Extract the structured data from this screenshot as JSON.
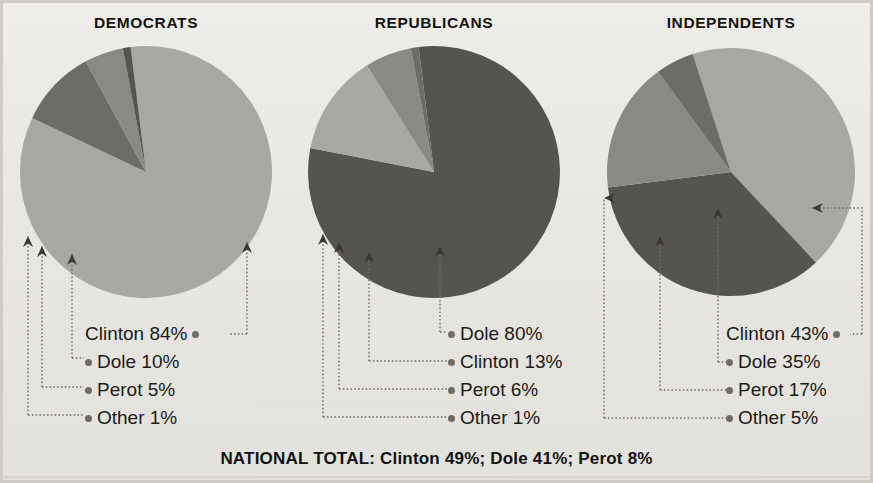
{
  "chart_data": [
    {
      "type": "pie",
      "title": "DEMOCRATS",
      "categories": [
        "Clinton",
        "Dole",
        "Perot",
        "Other"
      ],
      "values": [
        84,
        10,
        5,
        1
      ],
      "labels": [
        "Clinton 84%",
        "Dole 10%",
        "Perot 5%",
        "Other 1%"
      ],
      "colors": [
        "#a9a7a2",
        "#6e6c68",
        "#8b8984",
        "#565451"
      ],
      "center": [
        146,
        172
      ],
      "radius": 126,
      "start_angle_deg": -7
    },
    {
      "type": "pie",
      "title": "REPUBLICANS",
      "categories": [
        "Dole",
        "Clinton",
        "Perot",
        "Other"
      ],
      "values": [
        80,
        13,
        6,
        1
      ],
      "labels": [
        "Dole 80%",
        "Clinton 13%",
        "Perot 6%",
        "Other 1%"
      ],
      "colors": [
        "#565451",
        "#a9a7a2",
        "#8b8984",
        "#6e6c68"
      ],
      "center": [
        434,
        172
      ],
      "radius": 126,
      "start_angle_deg": -7
    },
    {
      "type": "pie",
      "title": "INDEPENDENTS",
      "categories": [
        "Clinton",
        "Dole",
        "Perot",
        "Other"
      ],
      "values": [
        43,
        35,
        17,
        5
      ],
      "labels": [
        "Clinton 43%",
        "Dole 35%",
        "Perot 17%",
        "Other 5%"
      ],
      "colors": [
        "#a9a7a2",
        "#565451",
        "#8b8984",
        "#6e6c68"
      ],
      "center": [
        731,
        172
      ],
      "radius": 124,
      "start_angle_deg": -18
    }
  ],
  "panels": [
    {
      "title": "DEMOCRATS",
      "title_x": 146,
      "title_y": 14,
      "labels_left": 85,
      "labels_top": 322,
      "label_align": "left",
      "rows": [
        {
          "text": "Clinton 84%",
          "dot": "post"
        },
        {
          "text": "Dole 10%",
          "dot": "pre"
        },
        {
          "text": "Perot 5%",
          "dot": "pre"
        },
        {
          "text": "Other 1%",
          "dot": "pre"
        }
      ]
    },
    {
      "title": "REPUBLICANS",
      "title_x": 434,
      "title_y": 14,
      "labels_left": 448,
      "labels_top": 322,
      "label_align": "left",
      "rows": [
        {
          "text": "Dole 80%",
          "dot": "pre"
        },
        {
          "text": "Clinton 13%",
          "dot": "pre"
        },
        {
          "text": "Perot 6%",
          "dot": "pre"
        },
        {
          "text": "Other 1%",
          "dot": "pre"
        }
      ]
    },
    {
      "title": "INDEPENDENTS",
      "title_x": 731,
      "title_y": 14,
      "labels_left": 726,
      "labels_top": 322,
      "label_align": "left",
      "rows": [
        {
          "text": "Clinton 43%",
          "dot": "post"
        },
        {
          "text": "Dole 35%",
          "dot": "pre"
        },
        {
          "text": "Perot 17%",
          "dot": "pre"
        },
        {
          "text": "Other 5%",
          "dot": "pre"
        }
      ]
    }
  ],
  "leaders": {
    "color": "#706d67",
    "paths": [
      {
        "d": "M 247 334 L 247 242",
        "arrow": "up",
        "name": "leader-dem-clinton"
      },
      {
        "d": "M 72 358 L 72 290 L 72 254",
        "arrow": "up",
        "name": "leader-dem-dole"
      },
      {
        "d": "M 42 387 L 42 292 L 42 246",
        "arrow": "up",
        "name": "leader-dem-perot"
      },
      {
        "d": "M 28 415 L 28 290 L 28 236",
        "arrow": "up",
        "name": "leader-dem-other"
      },
      {
        "d": "M 440 332 L 440 292 L 440 246",
        "arrow": "up",
        "name": "leader-rep-dole"
      },
      {
        "d": "M 369 361 L 369 292 L 369 252",
        "arrow": "up",
        "name": "leader-rep-clinton"
      },
      {
        "d": "M 339 389 L 339 292 L 339 242",
        "arrow": "up",
        "name": "leader-rep-perot"
      },
      {
        "d": "M 323 417 L 323 292 L 323 234",
        "arrow": "up",
        "name": "leader-rep-other"
      },
      {
        "d": "M 862 334 L 862 208 L 812 208",
        "arrow": "left",
        "name": "leader-ind-clinton"
      },
      {
        "d": "M 718 362 L 718 292 L 718 208",
        "arrow": "up",
        "name": "leader-ind-dole"
      },
      {
        "d": "M 660 390 L 660 292 L 660 236",
        "arrow": "up",
        "name": "leader-ind-perot"
      },
      {
        "d": "M 604 418 L 604 292 L 604 198",
        "arrow": "right-in",
        "name": "leader-ind-other"
      }
    ],
    "horizontals": [
      {
        "d": "M 247 334 L 228 334",
        "name": "leader-h-dem-clinton"
      },
      {
        "d": "M 72 358 L 84 358",
        "name": "leader-h-dem-dole"
      },
      {
        "d": "M 42 387 L 84 387",
        "name": "leader-h-dem-perot"
      },
      {
        "d": "M 28 415 L 84 415",
        "name": "leader-h-dem-other"
      },
      {
        "d": "M 440 332 L 447 332",
        "name": "leader-h-rep-dole"
      },
      {
        "d": "M 369 361 L 447 361",
        "name": "leader-h-rep-clinton"
      },
      {
        "d": "M 339 389 L 447 389",
        "name": "leader-h-rep-perot"
      },
      {
        "d": "M 323 417 L 447 417",
        "name": "leader-h-rep-other"
      },
      {
        "d": "M 862 334 L 850 334",
        "name": "leader-h-ind-clinton"
      },
      {
        "d": "M 718 362 L 726 362",
        "name": "leader-h-ind-dole"
      },
      {
        "d": "M 660 390 L 726 390",
        "name": "leader-h-ind-perot"
      },
      {
        "d": "M 604 418 L 726 418",
        "name": "leader-h-ind-other"
      }
    ]
  },
  "footer": {
    "total_text": "NATIONAL TOTAL: Clinton 49%; Dole 41%; Perot 8%"
  }
}
